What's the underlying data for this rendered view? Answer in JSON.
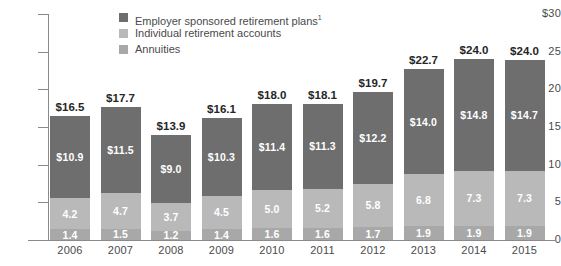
{
  "chart_data": {
    "type": "bar",
    "stacked": true,
    "title": "",
    "xlabel": "",
    "ylabel": "",
    "ylim": [
      0,
      30
    ],
    "yticks": [
      "$30",
      "25",
      "20",
      "15",
      "10",
      "5",
      "0"
    ],
    "ytick_values": [
      30,
      25,
      20,
      15,
      10,
      5,
      0
    ],
    "grid": false,
    "legend_position": "top-center",
    "categories": [
      "2006",
      "2007",
      "2008",
      "2009",
      "2010",
      "2011",
      "2012",
      "2013",
      "2014",
      "2015"
    ],
    "series": [
      {
        "name": "Employer sponsored retirement plans",
        "footnote_marker": "1",
        "color": "#6e6e6e",
        "values": [
          10.9,
          11.5,
          9.0,
          10.3,
          11.4,
          11.3,
          12.2,
          14.0,
          14.8,
          14.7
        ],
        "labels": [
          "$10.9",
          "$11.5",
          "$9.0",
          "$10.3",
          "$11.4",
          "$11.3",
          "$12.2",
          "$14.0",
          "$14.8",
          "$14.7"
        ]
      },
      {
        "name": "Individual retirement accounts",
        "color": "#b9b9b9",
        "values": [
          4.2,
          4.7,
          3.7,
          4.5,
          5.0,
          5.2,
          5.8,
          6.8,
          7.3,
          7.3
        ],
        "labels": [
          "4.2",
          "4.7",
          "3.7",
          "4.5",
          "5.0",
          "5.2",
          "5.8",
          "6.8",
          "7.3",
          "7.3"
        ]
      },
      {
        "name": "Annuities",
        "color": "#a8a8a8",
        "values": [
          1.4,
          1.5,
          1.2,
          1.4,
          1.6,
          1.6,
          1.7,
          1.9,
          1.9,
          1.9
        ],
        "labels": [
          "1.4",
          "1.5",
          "1.2",
          "1.4",
          "1.6",
          "1.6",
          "1.7",
          "1.9",
          "1.9",
          "1.9"
        ]
      }
    ],
    "totals": [
      16.5,
      17.7,
      13.9,
      16.1,
      18.0,
      18.1,
      19.7,
      22.7,
      24.0,
      24.0
    ],
    "total_labels": [
      "$16.5",
      "$17.7",
      "$13.9",
      "$16.1",
      "$18.0",
      "$18.1",
      "$19.7",
      "$22.7",
      "$24.0",
      "$24.0"
    ]
  },
  "legend": {
    "items": [
      {
        "label": "Employer sponsored retirement plans",
        "sup": "1",
        "color": "#6e6e6e"
      },
      {
        "label": "Individual retirement accounts",
        "sup": "",
        "color": "#b9b9b9"
      },
      {
        "label": "Annuities",
        "sup": "",
        "color": "#a8a8a8"
      }
    ]
  }
}
